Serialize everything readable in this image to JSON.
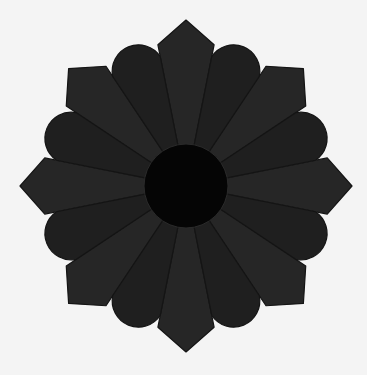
{
  "image": {
    "description": "Dresden-plate style rosette of 16 dark fabric petals alternating rounded and pointed tips around a black center circle on a white background",
    "width": 367,
    "height": 375
  },
  "rosette": {
    "center": [
      186,
      186
    ],
    "petal_count": 16,
    "pointed_tip_radius": 166,
    "rounded_tip_radius": 160,
    "center_radius": 42,
    "colors": {
      "background": "#f4f4f4",
      "petal_rounded": "#1f1f1f",
      "petal_pointed": "#262626",
      "seam": "#141414",
      "center": "#050505"
    }
  }
}
